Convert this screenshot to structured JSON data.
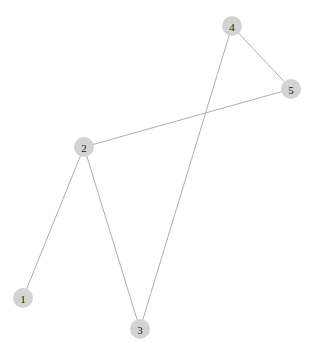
{
  "figure": {
    "kind": "undirected-graph-drawing",
    "width": 315,
    "height": 353,
    "background_color": "#ffffff"
  },
  "style": {
    "node_fill": "#d3d3d3",
    "node_radius": 10,
    "node_label_color": "#1a1a1a",
    "edge_color": "#999999",
    "edge_width": 0.8
  },
  "chart_data": {
    "type": "diagram",
    "title": "",
    "xlabel": "",
    "ylabel": "",
    "nodes": [
      {
        "id": "1",
        "label": "1",
        "x": 23,
        "y": 298
      },
      {
        "id": "2",
        "label": "2",
        "x": 84,
        "y": 147
      },
      {
        "id": "3",
        "label": "3",
        "x": 140,
        "y": 329
      },
      {
        "id": "4",
        "label": "4",
        "x": 232,
        "y": 26
      },
      {
        "id": "5",
        "label": "5",
        "x": 291,
        "y": 89
      }
    ],
    "edges": [
      {
        "source": "1",
        "target": "2"
      },
      {
        "source": "2",
        "target": "3"
      },
      {
        "source": "2",
        "target": "5"
      },
      {
        "source": "3",
        "target": "4"
      },
      {
        "source": "4",
        "target": "5"
      }
    ],
    "node_count": 5,
    "edge_count": 5,
    "legend": [],
    "annotations": []
  }
}
